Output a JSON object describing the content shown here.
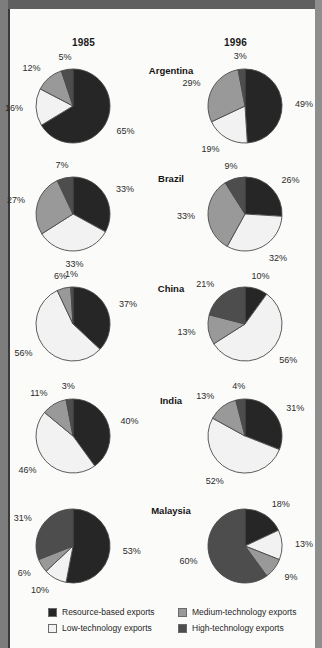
{
  "header": {
    "year_left": "1985",
    "year_right": "1996"
  },
  "legend": {
    "items": [
      {
        "label": "Resource-based exports",
        "color": "#262626",
        "key": "resource"
      },
      {
        "label": "Low-technology exports",
        "color": "#f2f2f2",
        "key": "low"
      },
      {
        "label": "Medium-technology exports",
        "color": "#999999",
        "key": "medium"
      },
      {
        "label": "High-technology exports",
        "color": "#4d4d4d",
        "key": "high"
      }
    ]
  },
  "colors": {
    "resource": "#262626",
    "low": "#f2f2f2",
    "medium": "#999999",
    "high": "#4d4d4d",
    "outline": "#4a4a4a",
    "page": "#fbfbfa"
  },
  "chart_data": {
    "type": "pie",
    "title": "",
    "categories": [
      "Resource-based exports",
      "Low-technology exports",
      "Medium-technology exports",
      "High-technology exports"
    ],
    "legend_position": "bottom",
    "grid": false,
    "units": "percent",
    "columns": [
      "1985",
      "1996"
    ],
    "rows": [
      "Argentina",
      "Brazil",
      "China",
      "India",
      "Malaysia"
    ],
    "charts": [
      {
        "country": "Argentina",
        "year": "1985",
        "values": [
          65,
          16,
          12,
          5
        ],
        "labels": [
          "65%",
          "16%",
          "12%",
          "5%"
        ]
      },
      {
        "country": "Argentina",
        "year": "1996",
        "values": [
          49,
          19,
          29,
          3
        ],
        "labels": [
          "49%",
          "19%",
          "29%",
          "3%"
        ]
      },
      {
        "country": "Brazil",
        "year": "1985",
        "values": [
          33,
          33,
          27,
          7
        ],
        "labels": [
          "33%",
          "33%",
          "27%",
          "7%"
        ]
      },
      {
        "country": "Brazil",
        "year": "1996",
        "values": [
          26,
          32,
          33,
          9
        ],
        "labels": [
          "26%",
          "32%",
          "33%",
          "9%"
        ]
      },
      {
        "country": "China",
        "year": "1985",
        "values": [
          37,
          56,
          6,
          1
        ],
        "labels": [
          "37%",
          "56%",
          "6%",
          "1%"
        ]
      },
      {
        "country": "China",
        "year": "1996",
        "values": [
          10,
          56,
          13,
          21
        ],
        "labels": [
          "10%",
          "56%",
          "13%",
          "21%"
        ]
      },
      {
        "country": "India",
        "year": "1985",
        "values": [
          40,
          46,
          11,
          3
        ],
        "labels": [
          "40%",
          "46%",
          "11%",
          "3%"
        ]
      },
      {
        "country": "India",
        "year": "1996",
        "values": [
          31,
          52,
          13,
          4
        ],
        "labels": [
          "31%",
          "52%",
          "13%",
          "4%"
        ]
      },
      {
        "country": "Malaysia",
        "year": "1985",
        "values": [
          53,
          10,
          6,
          31
        ],
        "labels": [
          "53%",
          "10%",
          "6%",
          "31%"
        ]
      },
      {
        "country": "Malaysia",
        "year": "1996",
        "values": [
          18,
          13,
          9,
          60
        ],
        "labels": [
          "18%",
          "13%",
          "9%",
          "60%"
        ]
      }
    ]
  }
}
